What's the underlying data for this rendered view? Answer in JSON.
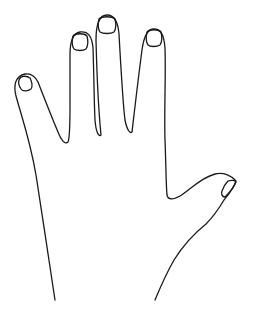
{
  "illustration": {
    "subject": "hand-outline",
    "orientation": "open hand, fingers up, thumb extended to right",
    "stroke_color": "#1a1a1a",
    "background_color": "#ffffff",
    "parts": [
      "pinky",
      "ring-finger",
      "middle-finger",
      "index-finger",
      "thumb",
      "palm-outline"
    ]
  }
}
